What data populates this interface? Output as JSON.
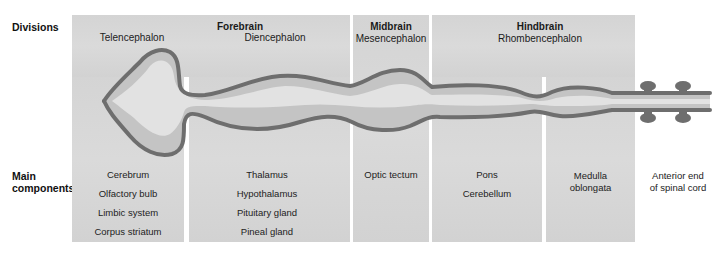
{
  "row_labels": {
    "divisions": "Divisions",
    "main_components_line1": "Main",
    "main_components_line2": "components"
  },
  "divisions": [
    {
      "name": "Forebrain",
      "subdivisions": [
        "Telencephalon",
        "Diencephalon"
      ]
    },
    {
      "name": "Midbrain",
      "subdivisions": [
        "Mesencephalon"
      ]
    },
    {
      "name": "Hindbrain",
      "subdivisions": [
        "Rhombencephalon"
      ]
    }
  ],
  "components": {
    "telencephalon": [
      "Cerebrum",
      "Olfactory bulb",
      "Limbic system",
      "Corpus striatum"
    ],
    "diencephalon": [
      "Thalamus",
      "Hypothalamus",
      "Pituitary gland",
      "Pineal gland"
    ],
    "mesencephalon": [
      "Optic tectum"
    ],
    "metencephalon": [
      "Pons",
      "Cerebellum"
    ],
    "myelencephalon": [
      "Medulla",
      "oblongata"
    ],
    "spinal_cord": [
      "Anterior end",
      "of spinal cord"
    ]
  },
  "colors": {
    "panel": "#d6d6d6",
    "tube_wall": "#6e6e6e",
    "tube_fill": "#c4c4c4",
    "ventricle": "#e6e6e6",
    "text": "#1a1a1a"
  }
}
